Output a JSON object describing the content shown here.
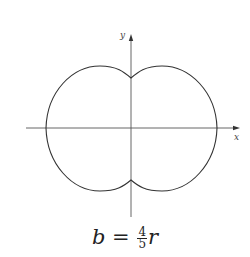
{
  "diagram": {
    "type": "epitrochoid-curve",
    "axes": {
      "x_label": "x",
      "y_label": "y"
    },
    "caption": {
      "lhs": "b",
      "eq": "=",
      "frac_num": "4",
      "frac_den": "5",
      "rhs": "r"
    },
    "colors": {
      "curve": "#333333",
      "axis": "#555555",
      "background": "#ffffff"
    }
  }
}
